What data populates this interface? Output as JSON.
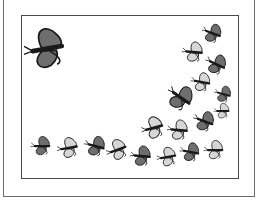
{
  "scene": {
    "description": "Clip-art frame with a swarm of butterflies",
    "colors": {
      "dark_wing": "#6e6e6e",
      "light_wing": "#d6d6d6",
      "outline": "#1a1a1a",
      "frame": "#4a4a4a",
      "background": "#ffffff"
    },
    "butterflies": [
      {
        "x": 45,
        "y": 49,
        "s": 1.55,
        "r": -10,
        "shade": "dark"
      },
      {
        "x": 212,
        "y": 33,
        "s": 0.75,
        "r": 20,
        "shade": "dark"
      },
      {
        "x": 193,
        "y": 52,
        "s": 0.8,
        "r": 5,
        "shade": "light"
      },
      {
        "x": 216,
        "y": 64,
        "s": 0.8,
        "r": 25,
        "shade": "dark"
      },
      {
        "x": 201,
        "y": 82,
        "s": 0.75,
        "r": 10,
        "shade": "light"
      },
      {
        "x": 180,
        "y": 97,
        "s": 1.0,
        "r": 35,
        "shade": "dark"
      },
      {
        "x": 223,
        "y": 94,
        "s": 0.65,
        "r": 15,
        "shade": "dark"
      },
      {
        "x": 222,
        "y": 111,
        "s": 0.6,
        "r": 0,
        "shade": "light"
      },
      {
        "x": 204,
        "y": 121,
        "s": 0.8,
        "r": 20,
        "shade": "dark"
      },
      {
        "x": 153,
        "y": 128,
        "s": 0.85,
        "r": -15,
        "shade": "light"
      },
      {
        "x": 178,
        "y": 130,
        "s": 0.8,
        "r": 5,
        "shade": "light"
      },
      {
        "x": 41,
        "y": 146,
        "s": 0.75,
        "r": 0,
        "shade": "dark"
      },
      {
        "x": 68,
        "y": 148,
        "s": 0.8,
        "r": -10,
        "shade": "light"
      },
      {
        "x": 95,
        "y": 146,
        "s": 0.8,
        "r": 15,
        "shade": "dark"
      },
      {
        "x": 117,
        "y": 150,
        "s": 0.8,
        "r": -20,
        "shade": "light"
      },
      {
        "x": 141,
        "y": 156,
        "s": 0.8,
        "r": 5,
        "shade": "dark"
      },
      {
        "x": 167,
        "y": 157,
        "s": 0.75,
        "r": -10,
        "shade": "light"
      },
      {
        "x": 190,
        "y": 152,
        "s": 0.75,
        "r": 10,
        "shade": "dark"
      },
      {
        "x": 214,
        "y": 150,
        "s": 0.75,
        "r": 0,
        "shade": "light"
      }
    ]
  }
}
